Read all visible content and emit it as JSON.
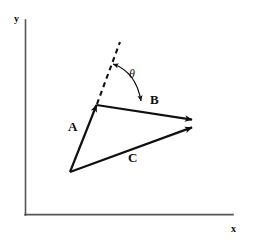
{
  "figure": {
    "background_color": "#ffffff",
    "ink_color": "#101010",
    "axis_color": "#55555a",
    "width": 253,
    "height": 241
  },
  "axes": {
    "x_label": "x",
    "y_label": "y",
    "origin": {
      "x": 25,
      "y": 215
    },
    "x_end": {
      "x": 233,
      "y": 215
    },
    "y_end": {
      "x": 25,
      "y": 20
    }
  },
  "vectors": [
    {
      "name": "A",
      "label": "A",
      "tail": {
        "x": 70,
        "y": 172
      },
      "head": {
        "x": 96,
        "y": 105
      },
      "style": "solid",
      "arrowhead": "filled"
    },
    {
      "name": "B",
      "label": "B",
      "tail": {
        "x": 96,
        "y": 105
      },
      "head": {
        "x": 193,
        "y": 120
      },
      "style": "solid",
      "arrowhead": "filled"
    },
    {
      "name": "C",
      "label": "C",
      "tail": {
        "x": 70,
        "y": 172
      },
      "head": {
        "x": 193,
        "y": 127
      },
      "style": "solid",
      "arrowhead": "filled"
    }
  ],
  "construction_line": {
    "name": "extension-of-A",
    "tail": {
      "x": 96,
      "y": 105
    },
    "head": {
      "x": 120,
      "y": 42
    },
    "style": "dashed",
    "dash_pattern": "5,4"
  },
  "angle": {
    "symbol": "θ",
    "label": "θ",
    "vertex": {
      "x": 96,
      "y": 105
    },
    "between": [
      "extension-of-A",
      "B"
    ],
    "arc_radius": 42,
    "arrow_ends": "both"
  },
  "labels": {
    "vector_a": "A",
    "vector_b": "B",
    "vector_c": "C",
    "theta": "θ",
    "axis_x": "x",
    "axis_y": "y"
  }
}
